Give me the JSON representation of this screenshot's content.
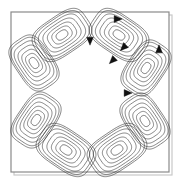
{
  "figure": {
    "kind": "streamline-contour-plot",
    "background_color": "#ffffff",
    "line_color": "#2b2b2b",
    "arrow_color": "#111111",
    "frame": {
      "name": "cavity-boundary",
      "x": 11,
      "y": 12,
      "width": 158,
      "height": 160,
      "stroke_color": "#8a8a8a",
      "stroke_width": 1.2,
      "shadow_color": "#c9c9c9"
    }
  },
  "chart_data": {
    "type": "line",
    "title": "",
    "subtitle": "",
    "xlabel": "",
    "ylabel": "",
    "xlim": [
      0,
      1
    ],
    "ylim": [
      0,
      1
    ],
    "grid": false,
    "legend": "none",
    "tick_labels_x": [],
    "tick_labels_y": [],
    "annotations": [],
    "series": [
      {
        "name": "vortex-top-left",
        "center": [
          62,
          35
        ],
        "rotation_deg": -34,
        "rx": 31,
        "ry": 20,
        "squareness": 0.62,
        "contour_levels": [
          0.2,
          0.34,
          0.48,
          0.62,
          0.76,
          0.88,
          0.96
        ],
        "sense": "clockwise"
      },
      {
        "name": "vortex-top-right",
        "center": [
          119,
          35
        ],
        "rotation_deg": 34,
        "rx": 31,
        "ry": 20,
        "squareness": 0.62,
        "contour_levels": [
          0.2,
          0.34,
          0.48,
          0.62,
          0.76,
          0.88,
          0.96
        ],
        "sense": "clockwise"
      },
      {
        "name": "vortex-left-upper",
        "center": [
          34,
          63
        ],
        "rotation_deg": 56,
        "rx": 29,
        "ry": 19,
        "squareness": 0.62,
        "contour_levels": [
          0.2,
          0.34,
          0.48,
          0.62,
          0.76,
          0.88,
          0.96
        ],
        "sense": "clockwise"
      },
      {
        "name": "vortex-right-upper",
        "center": [
          146,
          68
        ],
        "rotation_deg": -56,
        "rx": 29,
        "ry": 19,
        "squareness": 0.62,
        "contour_levels": [
          0.2,
          0.34,
          0.48,
          0.62,
          0.76,
          0.88,
          0.96
        ],
        "sense": "clockwise"
      },
      {
        "name": "vortex-left-lower",
        "center": [
          36,
          120
        ],
        "rotation_deg": -56,
        "rx": 29,
        "ry": 19,
        "squareness": 0.62,
        "contour_levels": [
          0.2,
          0.34,
          0.48,
          0.62,
          0.76,
          0.88,
          0.96
        ],
        "sense": "clockwise"
      },
      {
        "name": "vortex-right-lower",
        "center": [
          145,
          121
        ],
        "rotation_deg": 56,
        "rx": 29,
        "ry": 19,
        "squareness": 0.62,
        "contour_levels": [
          0.2,
          0.34,
          0.48,
          0.62,
          0.76,
          0.88,
          0.96
        ],
        "sense": "clockwise"
      },
      {
        "name": "vortex-bottom-left",
        "center": [
          66,
          150
        ],
        "rotation_deg": 34,
        "rx": 31,
        "ry": 20,
        "squareness": 0.62,
        "contour_levels": [
          0.2,
          0.34,
          0.48,
          0.62,
          0.76,
          0.88,
          0.96
        ],
        "sense": "clockwise"
      },
      {
        "name": "vortex-bottom-right",
        "center": [
          117,
          150
        ],
        "rotation_deg": -34,
        "rx": 31,
        "ry": 20,
        "squareness": 0.62,
        "contour_levels": [
          0.2,
          0.34,
          0.48,
          0.62,
          0.76,
          0.88,
          0.96
        ],
        "sense": "clockwise"
      }
    ],
    "flow_arrows": [
      {
        "name": "arrow-top-right-edge",
        "x": 117,
        "y": 19,
        "angle_deg": 0,
        "label": "right"
      },
      {
        "name": "arrow-top-mid-down",
        "x": 90,
        "y": 40,
        "angle_deg": 90,
        "label": "down"
      },
      {
        "name": "arrow-core-upper-right",
        "x": 124,
        "y": 47,
        "angle_deg": 135,
        "label": "down-left"
      },
      {
        "name": "arrow-core-right",
        "x": 113,
        "y": 60,
        "angle_deg": 135,
        "label": "down-left"
      },
      {
        "name": "arrow-right-edge-up",
        "x": 159,
        "y": 50,
        "angle_deg": 270,
        "label": "up"
      },
      {
        "name": "arrow-lower-right",
        "x": 127,
        "y": 93,
        "angle_deg": 0,
        "label": "right"
      }
    ]
  }
}
